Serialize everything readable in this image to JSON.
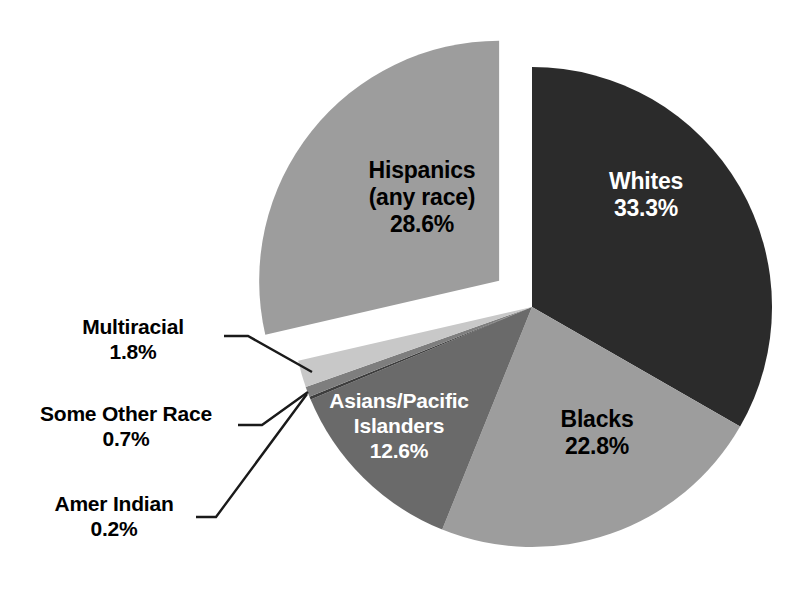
{
  "chart_data": {
    "type": "pie",
    "title": "",
    "subtitle": "",
    "xlabel": "",
    "ylabel": "",
    "legend_position": "none",
    "grid": false,
    "value_unit": "percent",
    "categories": [
      "Whites",
      "Blacks",
      "Asians/Pacific Islanders",
      "Amer Indian",
      "Some Other Race",
      "Multiracial",
      "Hispanics (any race)"
    ],
    "values": [
      33.3,
      22.8,
      12.6,
      0.2,
      0.7,
      1.8,
      28.6
    ],
    "slices": [
      {
        "id": "whites",
        "name": "Whites",
        "name_line1": "Whites",
        "name_line2": "",
        "value": 33.3,
        "value_label": "33.3%",
        "color": "#2b2b2b",
        "text_color": "#ffffff",
        "label_placement": "inside",
        "exploded": false
      },
      {
        "id": "blacks",
        "name": "Blacks",
        "name_line1": "Blacks",
        "name_line2": "",
        "value": 22.8,
        "value_label": "22.8%",
        "color": "#9d9d9d",
        "text_color": "#000000",
        "label_placement": "inside",
        "exploded": false
      },
      {
        "id": "asians",
        "name": "Asians/Pacific Islanders",
        "name_line1": "Asians/Pacific",
        "name_line2": "Islanders",
        "value": 12.6,
        "value_label": "12.6%",
        "color": "#6a6a6a",
        "text_color": "#ffffff",
        "label_placement": "inside",
        "exploded": false
      },
      {
        "id": "amer-indian",
        "name": "Amer Indian",
        "name_line1": "Amer Indian",
        "name_line2": "",
        "value": 0.2,
        "value_label": "0.2%",
        "color": "#3d3d3d",
        "text_color": "#000000",
        "label_placement": "outside-leader",
        "exploded": false
      },
      {
        "id": "some-other-race",
        "name": "Some Other Race",
        "name_line1": "Some Other Race",
        "name_line2": "",
        "value": 0.7,
        "value_label": "0.7%",
        "color": "#7e7e7e",
        "text_color": "#000000",
        "label_placement": "outside-leader",
        "exploded": false
      },
      {
        "id": "multiracial",
        "name": "Multiracial",
        "name_line1": "Multiracial",
        "name_line2": "",
        "value": 1.8,
        "value_label": "1.8%",
        "color": "#c8c8c8",
        "text_color": "#000000",
        "label_placement": "outside-leader",
        "exploded": false
      },
      {
        "id": "hispanics",
        "name": "Hispanics (any race)",
        "name_line1": "Hispanics",
        "name_line2": "(any race)",
        "value": 28.6,
        "value_label": "28.6%",
        "color": "#9d9d9d",
        "text_color": "#000000",
        "label_placement": "inside",
        "exploded": true
      }
    ],
    "total": 100.0,
    "background_color": "#ffffff",
    "start_angle_deg": 0,
    "direction": "clockwise"
  },
  "labels": {
    "whites": "Whites\n33.3%",
    "hispanics": "Hispanics\n(any race)\n28.6%",
    "blacks": "Blacks\n22.8%",
    "asians": "Asians/Pacific\nIslanders\n12.6%",
    "multiracial": "Multiracial\n1.8%",
    "some_other_race": "Some Other Race\n0.7%",
    "amer_indian": "Amer Indian\n0.2%"
  }
}
